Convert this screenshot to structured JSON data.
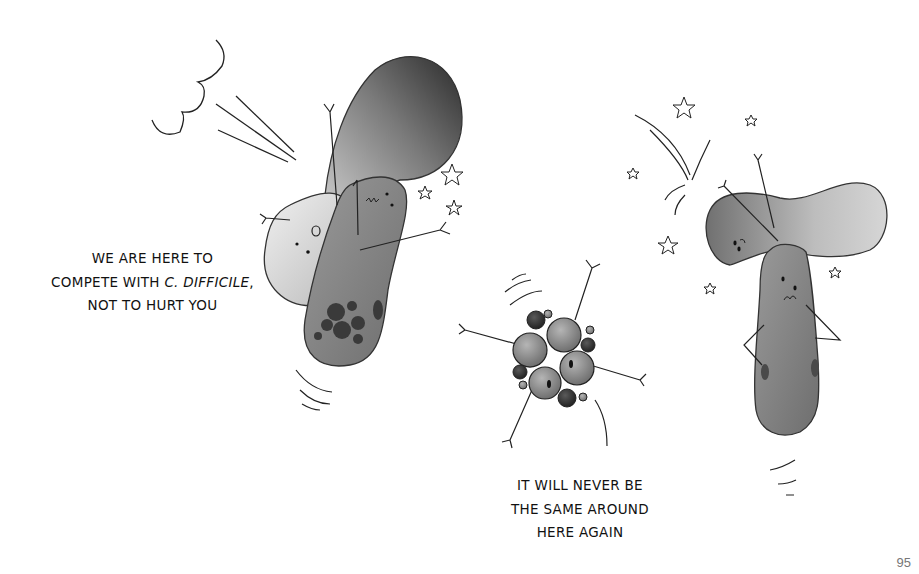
{
  "page": {
    "number": "95"
  },
  "captions": {
    "left": {
      "line1": "We are here to",
      "line2_prefix": "compete with ",
      "line2_italic": "C. difficile",
      "line2_suffix": ",",
      "line3": "not to hurt you"
    },
    "bottom": {
      "line1": "It will never be",
      "line2": "the same around",
      "line3": "here again"
    }
  },
  "illustration": {
    "characters": [
      {
        "id": "crashing-bacterium-pair",
        "description": "two rod-shaped bacteria colliding, one light and one dark with spots"
      },
      {
        "id": "spore-cluster",
        "description": "cluster of four round cells with spiky arms, spinning"
      },
      {
        "id": "dazed-bacterium-pair",
        "description": "two bacteria stacked in a T shape, dazed with stars"
      }
    ],
    "colors": {
      "ink": "#222222",
      "dark_fill": "#3a3a3a",
      "mid_fill": "#8a8a8a",
      "light_fill": "#d8d8d8"
    }
  }
}
